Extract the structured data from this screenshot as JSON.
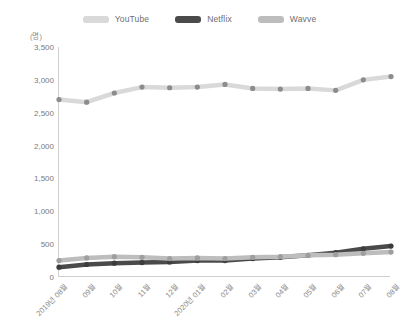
{
  "chart_data": {
    "type": "line",
    "title": "",
    "xlabel": "",
    "ylabel": "(명)",
    "unit_label": "(명)",
    "ylim": [
      0,
      3500
    ],
    "ytick_values": [
      0,
      500,
      1000,
      1500,
      2000,
      2500,
      3000,
      3500
    ],
    "ytick_labels": [
      "0",
      "500",
      "1,000",
      "1,500",
      "2,000",
      "2,500",
      "3,000",
      "3,500"
    ],
    "grid": false,
    "legend_position": "top-center",
    "categories": [
      "2019년 08월",
      "09월",
      "10월",
      "11월",
      "12월",
      "2020년 01월",
      "02월",
      "03월",
      "04월",
      "05월",
      "06월",
      "07월",
      "08월"
    ],
    "series": [
      {
        "name": "YouTube",
        "color": "#d9d9d9",
        "marker_color": "#8c8c8c",
        "values": [
          2700,
          2660,
          2800,
          2890,
          2880,
          2890,
          2930,
          2870,
          2860,
          2870,
          2840,
          3000,
          3050
        ]
      },
      {
        "name": "Netflix",
        "color": "#4a4a4a",
        "marker_color": "#3c3c3c",
        "values": [
          150,
          190,
          210,
          220,
          230,
          250,
          250,
          280,
          300,
          330,
          370,
          430,
          470
        ]
      },
      {
        "name": "Wavve",
        "color": "#bdbdbd",
        "marker_color": "#9e9e9e",
        "values": [
          250,
          290,
          310,
          300,
          280,
          290,
          280,
          300,
          310,
          330,
          340,
          360,
          380
        ]
      }
    ]
  },
  "legend": {
    "items": [
      {
        "label": "YouTube",
        "color": "#d9d9d9"
      },
      {
        "label": "Netflix",
        "color": "#4a4a4a"
      },
      {
        "label": "Wavve",
        "color": "#bdbdbd"
      }
    ]
  }
}
